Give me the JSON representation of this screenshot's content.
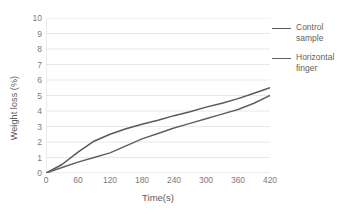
{
  "chart_data": {
    "type": "line",
    "title": "",
    "xlabel": "Time(s)",
    "ylabel": "Weight loss (%)",
    "xlim": [
      0,
      420
    ],
    "ylim": [
      0,
      10
    ],
    "xticks": [
      0,
      60,
      120,
      180,
      240,
      300,
      360,
      420
    ],
    "yticks": [
      0,
      1,
      2,
      3,
      4,
      5,
      6,
      7,
      8,
      9,
      10
    ],
    "grid": "horizontal",
    "legend_position": "right",
    "x": [
      0,
      30,
      60,
      90,
      120,
      150,
      180,
      210,
      240,
      270,
      300,
      330,
      360,
      390,
      420
    ],
    "series": [
      {
        "name": "Control sample",
        "color": "#595959",
        "values": [
          0,
          0.55,
          1.35,
          2.05,
          2.5,
          2.85,
          3.15,
          3.4,
          3.7,
          3.95,
          4.25,
          4.5,
          4.8,
          5.15,
          5.5
        ]
      },
      {
        "name": "Horizontal finger",
        "color": "#606060",
        "values": [
          0,
          0.35,
          0.7,
          1.0,
          1.3,
          1.75,
          2.2,
          2.55,
          2.9,
          3.2,
          3.5,
          3.8,
          4.1,
          4.5,
          5.0
        ]
      }
    ]
  },
  "axes": {
    "y_title": "Weight loss (%)",
    "x_title": "Time(s)",
    "y_tick_labels": [
      "10",
      "9",
      "8",
      "7",
      "6",
      "5",
      "4",
      "3",
      "2",
      "1",
      "0"
    ],
    "x_tick_labels": [
      "0",
      "60",
      "120",
      "180",
      "240",
      "300",
      "360",
      "420"
    ]
  },
  "legend": {
    "items": [
      {
        "label": "Control sample",
        "color": "#595959"
      },
      {
        "label": "Horizontal finger",
        "color": "#606060"
      }
    ]
  },
  "style": {
    "background": "#ffffff",
    "gridline_color": "#e8e8e8",
    "axis_line_color": "#d9d9d9",
    "tick_label_color": "#7b7b7b"
  }
}
